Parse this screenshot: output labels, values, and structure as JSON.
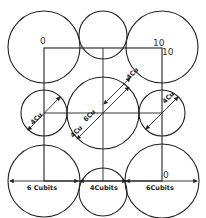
{
  "diagram": {
    "type": "circles-in-square geometric construction",
    "stroke_color": "#222222",
    "background_color": "#ffffff",
    "corner_labels": {
      "top_left": "0",
      "top_right_upper": "10",
      "top_right_lower": "10",
      "bottom_right": "0"
    },
    "dimension_labels": {
      "bottom_left": "6 Cubits",
      "bottom_middle": "4Cubits",
      "bottom_right": "6Cubits",
      "left_small_diag": "4Cu",
      "center_diag_upper": "6Cu",
      "center_diag_lower": "6Cu",
      "center_diag_small": "4Cu",
      "top_diag": "4Cu",
      "right_small_diag": "4Cu"
    },
    "circles": [
      {
        "name": "top-left-large",
        "cx": 44,
        "cy": 47,
        "r": 36
      },
      {
        "name": "top-middle-small",
        "cx": 103,
        "cy": 35,
        "r": 24
      },
      {
        "name": "top-right-large",
        "cx": 162,
        "cy": 47,
        "r": 36
      },
      {
        "name": "middle-left-small",
        "cx": 44,
        "cy": 113,
        "r": 23
      },
      {
        "name": "center-large",
        "cx": 103,
        "cy": 113,
        "r": 36
      },
      {
        "name": "middle-right-small",
        "cx": 162,
        "cy": 113,
        "r": 23
      },
      {
        "name": "bottom-left-large",
        "cx": 44,
        "cy": 181,
        "r": 36
      },
      {
        "name": "bottom-middle-small",
        "cx": 103,
        "cy": 192,
        "r": 24
      },
      {
        "name": "bottom-right-large",
        "cx": 162,
        "cy": 181,
        "r": 37
      }
    ],
    "square": {
      "x": 44,
      "y": 48,
      "width": 118,
      "height": 133
    }
  }
}
